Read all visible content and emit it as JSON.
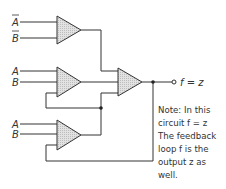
{
  "diagram": {
    "type": "logic-circuit",
    "gates": [
      {
        "id": "gate-top",
        "inputs": [
          "A̅",
          "B̅"
        ]
      },
      {
        "id": "gate-middle",
        "inputs": [
          "A",
          "B",
          "feedback"
        ]
      },
      {
        "id": "gate-bottom",
        "inputs": [
          "A",
          "B",
          "feedback"
        ]
      },
      {
        "id": "gate-output",
        "inputs": [
          "gate-top",
          "gate-middle",
          "gate-bottom"
        ]
      }
    ],
    "input_labels": {
      "top_a": "A",
      "top_b": "B",
      "mid_a": "A",
      "mid_b": "B",
      "bot_a": "A",
      "bot_b": "B"
    },
    "output_label": "f = z",
    "note_lines": [
      "Note: In this",
      "circuit  f = z",
      "The feedback",
      "loop  f  is the",
      "output  z  as",
      "well."
    ],
    "colors": {
      "line": "#333333",
      "gate_fill": "#d4d4d4",
      "background": "#ffffff"
    }
  }
}
